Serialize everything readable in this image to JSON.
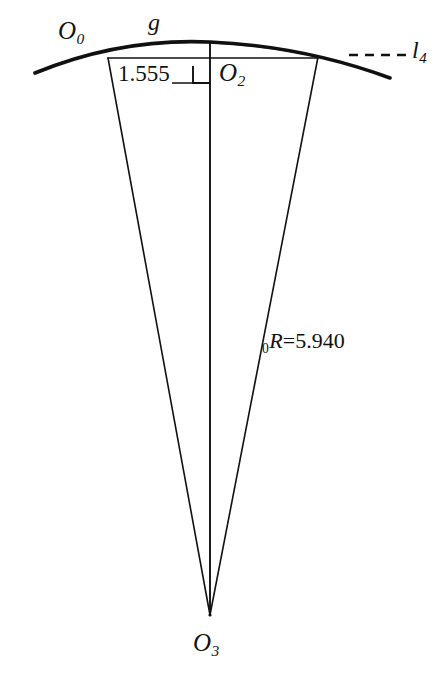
{
  "figure": {
    "type": "geometric-construction-diagram",
    "background_color": "#ffffff",
    "stroke_color": "#111111"
  },
  "labels": {
    "arc_left_point": "O",
    "arc_left_point_sub": "0",
    "arc_name": "g",
    "mid_ordinate_value": "1.555",
    "mid_point": "O",
    "mid_point_sub": "2",
    "tangent_line": "l",
    "tangent_line_sub": "4",
    "radius_prefix_sub": "0",
    "radius_symbol": "R",
    "radius_equals": "=",
    "radius_value": "5.940",
    "center_point": "O",
    "center_point_sub": "3"
  },
  "geometry": {
    "arc": {
      "start": [
        35,
        73
      ],
      "apex": [
        210,
        42
      ],
      "end": [
        390,
        78
      ],
      "stroke_width": 3.4
    },
    "chord": {
      "start": [
        108,
        58
      ],
      "end": [
        318,
        58
      ],
      "stroke_width": 1.5
    },
    "radii": [
      {
        "name": "left-radius",
        "from": [
          108,
          58
        ],
        "to": [
          210,
          615
        ]
      },
      {
        "name": "center-radius",
        "from": [
          210,
          42
        ],
        "to": [
          210,
          615
        ]
      },
      {
        "name": "right-radius",
        "from": [
          318,
          57
        ],
        "to": [
          210,
          615
        ]
      }
    ],
    "dimension_line": {
      "name": "mid-ordinate",
      "from": [
        176,
        82
      ],
      "to": [
        210,
        82
      ],
      "value": "1.555"
    },
    "right_angle_marker": {
      "corner": [
        210,
        82
      ],
      "size": 17
    },
    "tangent_dashed_line": {
      "from": [
        349,
        55
      ],
      "to": [
        406,
        55
      ],
      "dash": "9,7",
      "stroke_width": 2.2
    },
    "center_point": [
      210,
      615
    ],
    "canvas": {
      "width": 448,
      "height": 673
    }
  }
}
